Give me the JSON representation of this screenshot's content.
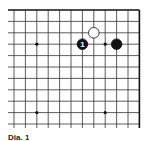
{
  "diagram": {
    "type": "go-board-corner",
    "corner": "top-right",
    "grid": {
      "columns_visible": 12,
      "rows_visible": 11,
      "origin_x": 14,
      "origin_y": 10,
      "spacing": 11.4,
      "left_extend_to": 8,
      "bottom_extend_to": 128,
      "line_color": "#333333",
      "edge_color": "#111111"
    },
    "star_points": [
      {
        "col": 2,
        "row": 3
      },
      {
        "col": 8,
        "row": 3
      },
      {
        "col": 2,
        "row": 9
      },
      {
        "col": 8,
        "row": 9
      }
    ],
    "stones": [
      {
        "color": "white",
        "col": 7,
        "row": 2,
        "label": ""
      },
      {
        "color": "black",
        "col": 6,
        "row": 3,
        "label": "1"
      },
      {
        "color": "black",
        "col": 9,
        "row": 3,
        "label": ""
      }
    ],
    "caption": "Dia. 1"
  }
}
